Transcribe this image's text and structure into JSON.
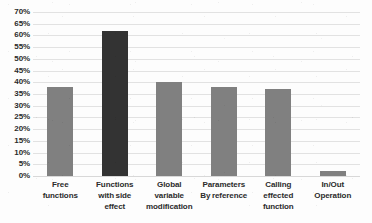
{
  "chart_data": {
    "type": "bar",
    "title": "",
    "xlabel": "",
    "ylabel": "",
    "ylim": [
      0,
      70
    ],
    "ytick_labels": [
      "70%",
      "65%",
      "60%",
      "55%",
      "50%",
      "45%",
      "40%",
      "35%",
      "30%",
      "25%",
      "20%",
      "15%",
      "10%",
      "5%",
      "0%"
    ],
    "ytick_values": [
      70,
      65,
      60,
      55,
      50,
      45,
      40,
      35,
      30,
      25,
      20,
      15,
      10,
      5,
      0
    ],
    "grid": true,
    "legend": "none",
    "categories": [
      "Free functions",
      "Functions with side effect",
      "Global variable modification",
      "Parameters By reference",
      "Calling effected function",
      "In/Out Operation"
    ],
    "category_lines": [
      [
        "Free",
        "functions"
      ],
      [
        "Functions",
        "with side",
        "effect"
      ],
      [
        "Global",
        "variable",
        "modification"
      ],
      [
        "Parameters",
        "By reference"
      ],
      [
        "Calling",
        "effected",
        "function"
      ],
      [
        "In/Out",
        "Operation"
      ]
    ],
    "values": [
      38,
      62,
      40,
      38,
      37,
      2
    ],
    "bar_colors": [
      "#808080",
      "#333333",
      "#808080",
      "#808080",
      "#808080",
      "#808080"
    ],
    "colors": {
      "bar_gray": "#808080",
      "bar_dark": "#333333",
      "gridline": "#e2e2e2",
      "text": "#2b2b2b",
      "background": "#fdfdfd"
    }
  }
}
